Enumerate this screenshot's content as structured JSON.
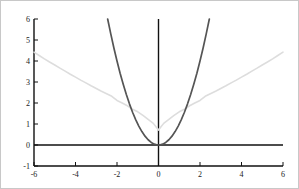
{
  "chart_data": {
    "type": "line",
    "title": "",
    "subtitle": "",
    "xlabel": "",
    "ylabel": "",
    "xlim": [
      -6,
      6
    ],
    "ylim": [
      -1,
      6
    ],
    "grid": false,
    "legend": "none",
    "xticks": [
      -6,
      -4,
      -2,
      0,
      2,
      4,
      6
    ],
    "xtick_labels": [
      "-6",
      "-4",
      "-2",
      "0",
      "2",
      "4",
      "6"
    ],
    "yticks": [
      -1,
      0,
      1,
      2,
      3,
      4,
      5,
      6
    ],
    "ytick_labels": [
      "-1",
      "0",
      "1",
      "2",
      "3",
      "4",
      "5",
      "6"
    ],
    "axis_origin_x": 0,
    "axis_origin_y": 0,
    "series": [
      {
        "name": "light-curve",
        "color": "#dddddd",
        "width": 1.6,
        "x": [
          -6,
          -5.75,
          -5.5,
          -5.25,
          -5,
          -4.75,
          -4.5,
          -4.25,
          -4,
          -3.75,
          -3.5,
          -3.25,
          -3,
          -2.75,
          -2.5,
          -2.25,
          -2,
          -1.75,
          -1.5,
          -1.25,
          -1,
          -0.75,
          -0.5,
          -0.25,
          0,
          0.25,
          0.5,
          0.75,
          1,
          1.25,
          1.5,
          1.75,
          2,
          2.25,
          2.5,
          2.75,
          3,
          3.25,
          3.5,
          3.75,
          4,
          4.25,
          4.5,
          4.75,
          5,
          5.25,
          5.5,
          5.75,
          6
        ],
        "values": [
          4.42,
          4.26,
          4.1,
          3.95,
          3.81,
          3.66,
          3.52,
          3.37,
          3.23,
          3.09,
          2.96,
          2.82,
          2.69,
          2.56,
          2.44,
          2.32,
          2.12,
          2.0,
          1.87,
          1.7,
          1.58,
          1.41,
          1.22,
          1.03,
          0.71,
          1.03,
          1.22,
          1.41,
          1.58,
          1.7,
          1.87,
          2.0,
          2.12,
          2.32,
          2.44,
          2.56,
          2.69,
          2.82,
          2.96,
          3.09,
          3.23,
          3.37,
          3.52,
          3.66,
          3.81,
          3.95,
          4.1,
          4.26,
          4.42
        ]
      },
      {
        "name": "dark-parabola",
        "color": "#555555",
        "width": 1.7,
        "x": [
          -2.45,
          -2.3,
          -2.15,
          -2.0,
          -1.85,
          -1.7,
          -1.55,
          -1.4,
          -1.25,
          -1.1,
          -0.95,
          -0.8,
          -0.65,
          -0.5,
          -0.35,
          -0.2,
          -0.05,
          0,
          0.05,
          0.2,
          0.35,
          0.5,
          0.65,
          0.8,
          0.95,
          1.1,
          1.25,
          1.4,
          1.55,
          1.7,
          1.85,
          2.0,
          2.15,
          2.3,
          2.45
        ],
        "values": [
          6.0,
          5.29,
          4.62,
          4.0,
          3.42,
          2.89,
          2.4,
          1.96,
          1.56,
          1.21,
          0.9,
          0.64,
          0.42,
          0.25,
          0.12,
          0.04,
          0.0,
          0.0,
          0.0,
          0.04,
          0.12,
          0.25,
          0.42,
          0.64,
          0.9,
          1.21,
          1.56,
          1.96,
          2.4,
          2.89,
          3.42,
          4.0,
          4.62,
          5.29,
          6.0
        ]
      }
    ],
    "axis_color": "#111111",
    "border_color": "#c8c8c8",
    "background_color": "#ffffff"
  }
}
